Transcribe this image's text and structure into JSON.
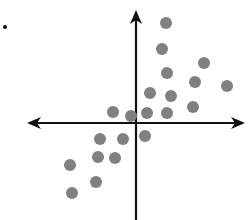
{
  "chart_data": {
    "type": "scatter",
    "title": "",
    "xlabel": "",
    "ylabel": "",
    "grid": false,
    "legend": null,
    "axes": {
      "style": "cartesian-cross-with-arrows",
      "origin_px": [
        136,
        123
      ],
      "x_axis": {
        "from_px": 27,
        "to_px": 245,
        "y_px": 123,
        "arrows": "both"
      },
      "y_axis": {
        "from_px": 10,
        "to_px": 220,
        "x_px": 136,
        "arrows": "top"
      }
    },
    "units_per_px": 1,
    "points_px": [
      [
        166,
        23
      ],
      [
        162,
        49
      ],
      [
        204,
        63
      ],
      [
        167,
        73
      ],
      [
        195,
        82
      ],
      [
        227,
        86
      ],
      [
        150,
        93
      ],
      [
        171,
        96
      ],
      [
        193,
        107
      ],
      [
        113,
        112
      ],
      [
        131,
        116
      ],
      [
        147,
        113
      ],
      [
        167,
        113
      ],
      [
        100,
        139
      ],
      [
        123,
        139
      ],
      [
        145,
        136
      ],
      [
        98,
        157
      ],
      [
        115,
        158
      ],
      [
        70,
        165
      ],
      [
        96,
        182
      ],
      [
        72,
        193
      ]
    ],
    "points_relative_to_origin": [
      {
        "x": 30,
        "y": 100
      },
      {
        "x": 26,
        "y": 74
      },
      {
        "x": 68,
        "y": 60
      },
      {
        "x": 31,
        "y": 50
      },
      {
        "x": 59,
        "y": 41
      },
      {
        "x": 91,
        "y": 37
      },
      {
        "x": 14,
        "y": 30
      },
      {
        "x": 35,
        "y": 27
      },
      {
        "x": 57,
        "y": 16
      },
      {
        "x": -23,
        "y": 11
      },
      {
        "x": -5,
        "y": 7
      },
      {
        "x": 11,
        "y": 10
      },
      {
        "x": 31,
        "y": 10
      },
      {
        "x": -36,
        "y": -16
      },
      {
        "x": -13,
        "y": -16
      },
      {
        "x": 9,
        "y": -13
      },
      {
        "x": -38,
        "y": -34
      },
      {
        "x": -21,
        "y": -35
      },
      {
        "x": -66,
        "y": -42
      },
      {
        "x": -40,
        "y": -59
      },
      {
        "x": -64,
        "y": -70
      }
    ],
    "point_style": {
      "color": "#808080",
      "radius": 6
    },
    "axis_color": "#111111",
    "annotations": [
      {
        "type": "marker",
        "shape": "dot",
        "x_px": 5,
        "y_px": 27,
        "color": "#111111",
        "radius": 2
      }
    ],
    "trend": "positive correlation"
  }
}
